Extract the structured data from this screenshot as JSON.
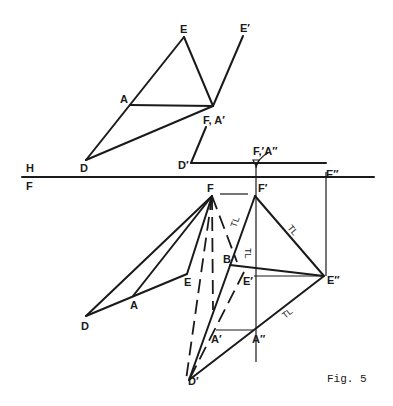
{
  "figure": {
    "caption": "Fig. 5",
    "plane_labels": {
      "top": "H",
      "bottom": "F"
    },
    "top_view_labels": {
      "E": "E",
      "E_prime": "E′",
      "A": "A",
      "F_A_prime": "F, A′",
      "D": "D",
      "D_prime": "D′",
      "F_prime_A_double": "F,′A″",
      "E_double": "E″"
    },
    "front_view_labels": {
      "F": "F",
      "F_prime": "F′",
      "B": "B",
      "E": "E",
      "E_prime": "E′",
      "E_double": "E″",
      "A": "A",
      "D": "D",
      "A_prime": "A′",
      "A_double": "A″",
      "D_prime": "D′"
    },
    "true_length_marks": [
      "TL",
      "TL",
      "TL",
      "TL"
    ],
    "colors": {
      "ink": "#1a1a1a",
      "paper": "#ffffff"
    }
  }
}
